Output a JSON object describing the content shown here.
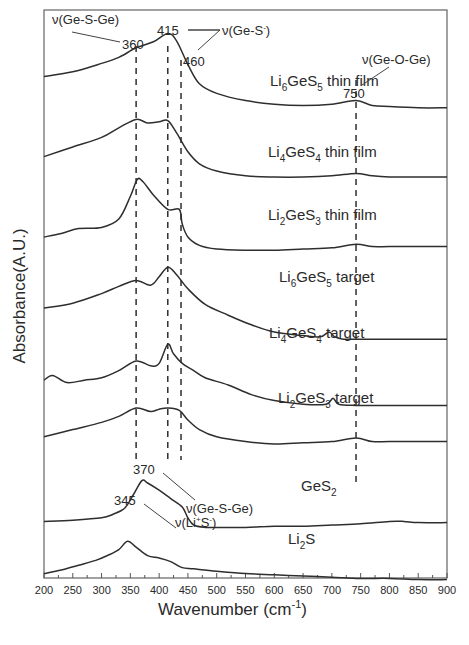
{
  "chart_data": {
    "type": "line",
    "title": "",
    "xlabel": "Wavenumber (cm⁻¹)",
    "xlabel_main": "Wavenumber (cm",
    "xlabel_sup": "-1",
    "xlabel_close": ")",
    "ylabel": "Absorbance(A.U.)",
    "xlim": [
      200,
      900
    ],
    "x_ticks": [
      200,
      250,
      300,
      350,
      400,
      450,
      500,
      550,
      600,
      650,
      700,
      750,
      800,
      850,
      900
    ],
    "y_ticks_shown": false,
    "grid": false,
    "legend": "inline labels next to each curve",
    "series": [
      {
        "name": "Li6GeS5 thin film",
        "base": "Li",
        "sub1": "6",
        "mid": "GeS",
        "sub2": "5",
        "suffix": " thin film",
        "x": [
          200,
          250,
          300,
          330,
          360,
          390,
          415,
          430,
          450,
          470,
          500,
          550,
          600,
          650,
          700,
          742,
          770,
          800,
          850,
          900
        ],
        "y": [
          82,
          86,
          93,
          98,
          106,
          111,
          118,
          112,
          92,
          76,
          68,
          62,
          59,
          58,
          59,
          62,
          58,
          57,
          56,
          56
        ]
      },
      {
        "name": "Li4GeS4 thin film",
        "base": "Li",
        "sub1": "4",
        "mid": "GeS",
        "sub2": "4",
        "suffix": " thin film",
        "x": [
          200,
          250,
          300,
          330,
          360,
          380,
          400,
          415,
          430,
          450,
          470,
          500,
          550,
          600,
          650,
          700,
          742,
          770,
          800,
          850,
          900
        ],
        "y": [
          72,
          80,
          88,
          96,
          103,
          100,
          101,
          102,
          92,
          76,
          66,
          60,
          56,
          55,
          55,
          56,
          58,
          56,
          55,
          55,
          55
        ]
      },
      {
        "name": "Li2GeS3 thin film",
        "base": "Li",
        "sub1": "2",
        "mid": "GeS",
        "sub2": "3",
        "suffix": " thin film",
        "x": [
          200,
          230,
          260,
          300,
          330,
          350,
          362,
          372,
          390,
          415,
          435,
          440,
          450,
          470,
          500,
          550,
          600,
          650,
          700,
          742,
          770,
          800,
          850,
          900
        ],
        "y": [
          65,
          68,
          72,
          73,
          80,
          99,
          113,
          111,
          100,
          88,
          88,
          76,
          65,
          58,
          55,
          54,
          54,
          55,
          56,
          59,
          57,
          57,
          57,
          57
        ]
      },
      {
        "name": "Li6GeS5 target",
        "base": "Li",
        "sub1": "6",
        "mid": "GeS",
        "sub2": "5",
        "suffix": " target",
        "x": [
          200,
          250,
          300,
          330,
          360,
          385,
          400,
          415,
          430,
          450,
          480,
          520,
          560,
          600,
          650,
          680,
          695,
          705,
          720,
          742,
          800,
          850,
          900
        ],
        "y": [
          60,
          64,
          72,
          78,
          83,
          79,
          86,
          94,
          88,
          76,
          63,
          54,
          46,
          40,
          37,
          36,
          40,
          36,
          34,
          34,
          34,
          34,
          34
        ]
      },
      {
        "name": "Li4GeS4 target",
        "base": "Li",
        "sub1": "4",
        "mid": "GeS",
        "sub2": "4",
        "suffix": " target",
        "x": [
          200,
          215,
          240,
          270,
          300,
          330,
          360,
          385,
          400,
          415,
          425,
          440,
          460,
          480,
          520,
          560,
          600,
          650,
          690,
          702,
          712,
          742,
          800,
          850,
          900
        ],
        "y": [
          54,
          58,
          52,
          54,
          56,
          62,
          70,
          66,
          68,
          84,
          76,
          68,
          62,
          56,
          50,
          42,
          37,
          34,
          34,
          39,
          34,
          33,
          33,
          33,
          33
        ]
      },
      {
        "name": "Li2GeS3 target",
        "base": "Li",
        "sub1": "2",
        "mid": "GeS",
        "sub2": "3",
        "suffix": " target",
        "x": [
          200,
          250,
          300,
          330,
          360,
          385,
          400,
          415,
          435,
          450,
          470,
          500,
          550,
          600,
          650,
          700,
          742,
          770,
          800,
          850,
          900
        ],
        "y": [
          46,
          52,
          58,
          63,
          70,
          67,
          69,
          70,
          68,
          60,
          52,
          46,
          42,
          40,
          41,
          42,
          45,
          42,
          42,
          42,
          42
        ]
      },
      {
        "name": "GeS2",
        "base": "GeS",
        "sub1": "",
        "mid": "",
        "sub2": "2",
        "suffix": "",
        "x": [
          200,
          250,
          300,
          320,
          340,
          355,
          370,
          380,
          400,
          420,
          440,
          450,
          460,
          480,
          500,
          550,
          600,
          650,
          700,
          750,
          800,
          825,
          850,
          900
        ],
        "y": [
          28,
          29,
          31,
          34,
          39,
          50,
          62,
          60,
          54,
          47,
          40,
          31,
          25,
          23,
          23,
          23,
          24,
          24,
          25,
          26,
          28,
          28,
          27,
          27
        ]
      },
      {
        "name": "Li2S",
        "base": "Li",
        "sub1": "2",
        "mid": "S",
        "sub2": "",
        "suffix": "",
        "x": [
          200,
          230,
          260,
          290,
          310,
          330,
          345,
          360,
          380,
          400,
          420,
          440,
          460,
          500,
          550,
          600,
          650,
          700,
          750,
          800,
          850,
          900
        ],
        "y": [
          12,
          15,
          19,
          23,
          27,
          32,
          39,
          34,
          27,
          25,
          22,
          17,
          16,
          14,
          12,
          11,
          10,
          9,
          8,
          8,
          7,
          7
        ]
      }
    ],
    "vertical_markers": [
      {
        "x": 360,
        "label": "360"
      },
      {
        "x": 415,
        "label": "415"
      },
      {
        "x": 438,
        "label": "460"
      },
      {
        "x": 742,
        "label": "750"
      }
    ],
    "annotations": [
      {
        "text": "ν(Ge-S-Ge)",
        "target": "360"
      },
      {
        "text": "ν(Ge-S⁻)",
        "main": "ν(Ge-S",
        "sup": "-",
        "close": ")",
        "targets": [
          "415",
          "460"
        ]
      },
      {
        "text": "ν(Ge-O-Ge)",
        "target": "750"
      },
      {
        "text": "370",
        "note": "GeS2 peak"
      },
      {
        "text": "ν(Ge-S-Ge)",
        "note": "GeS2 band"
      },
      {
        "text": "345",
        "note": "Li2S peak"
      },
      {
        "text": "ν(Li⁺S⁻)",
        "main1": "ν(Li",
        "sup1": "+",
        "main2": "S",
        "sup2": "-",
        "close": ")"
      }
    ]
  },
  "labels": {
    "ann_gesge_top": "ν(Ge-S-Ge)",
    "ann_360": "360",
    "ann_415": "415",
    "ann_460": "460",
    "ann_ges_main": "ν(Ge-S",
    "ann_ges_sup": "-",
    "ann_ges_close": ")",
    "ann_750": "750",
    "ann_gesoge": "ν(Ge-O-Ge)",
    "ann_370": "370",
    "ann_gesge_bottom": "ν(Ge-S-Ge)",
    "ann_345": "345",
    "ann_lis_a": "ν(Li",
    "ann_lis_sup1": "+",
    "ann_lis_b": "S",
    "ann_lis_sup2": "-",
    "ann_lis_close": ")"
  }
}
